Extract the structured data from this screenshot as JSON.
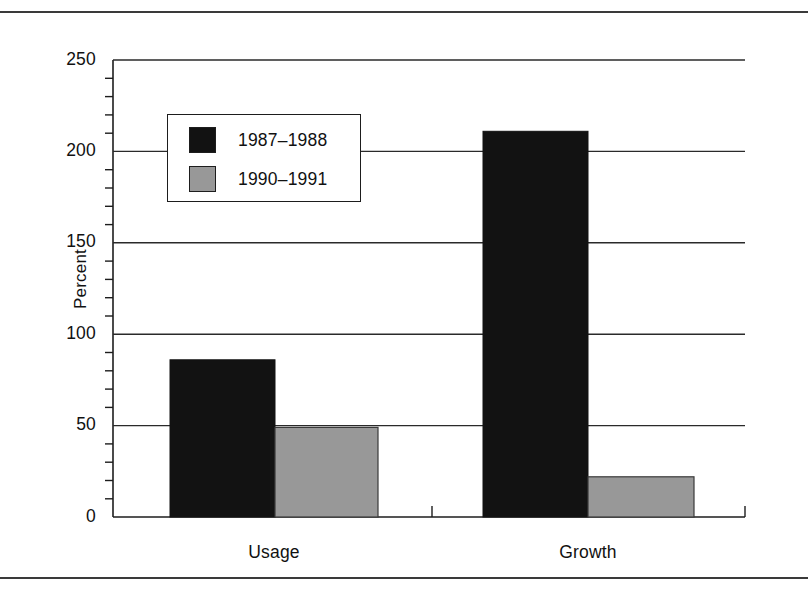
{
  "figure": {
    "has_top_rule": true,
    "has_bottom_rule": true,
    "rule_color": "#3a3a3a"
  },
  "chart_data": {
    "type": "bar",
    "title": "",
    "subtitle": "",
    "xlabel": "",
    "ylabel": "Percent",
    "categories": [
      "Usage",
      "Growth"
    ],
    "series": [
      {
        "name": "1987–1988",
        "color": "#121212",
        "values": [
          86,
          211
        ]
      },
      {
        "name": "1990–1991",
        "color": "#989898",
        "values": [
          49,
          22
        ]
      }
    ],
    "ylim": [
      0,
      250
    ],
    "ytick_labels": [
      "0",
      "50",
      "100",
      "150",
      "200",
      "250"
    ],
    "ytick_values": [
      0,
      50,
      100,
      150,
      200,
      250
    ],
    "yminor_step": 10,
    "grid": "horizontal-major",
    "legend_position": "upper-left-inside",
    "legend_entries": [
      "1987–1988",
      "1990–1991"
    ],
    "annotations": []
  },
  "legend": {
    "rows": [
      {
        "label": "1987–1988",
        "swatch_color": "#121212"
      },
      {
        "label": "1990–1991",
        "swatch_color": "#989898"
      }
    ]
  },
  "axes": {
    "y_title": "Percent",
    "y_ticks": [
      {
        "label": "250"
      },
      {
        "label": "200"
      },
      {
        "label": "150"
      },
      {
        "label": "100"
      },
      {
        "label": "50"
      },
      {
        "label": "0"
      }
    ],
    "x_ticks": [
      {
        "label": "Usage"
      },
      {
        "label": "Growth"
      }
    ]
  },
  "colors": {
    "series_1": "#121212",
    "series_2": "#989898",
    "axis": "#1d1d1d",
    "grid": "#2a2a2a",
    "background": "#ffffff"
  }
}
